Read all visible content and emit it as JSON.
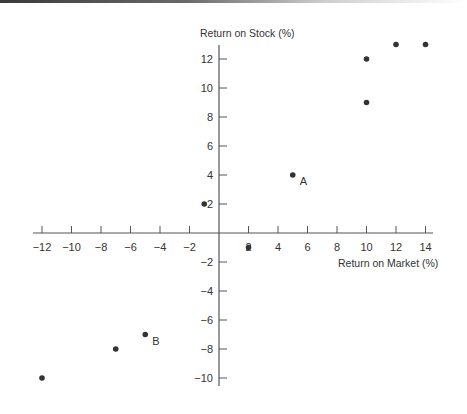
{
  "chart_data": {
    "type": "scatter",
    "title": "",
    "xlabel": "Return on Market (%)",
    "ylabel": "Return on Stock (%)",
    "xlim": [
      -12.5,
      14.5
    ],
    "ylim": [
      -10.5,
      12.5
    ],
    "x_ticks": [
      -12,
      -10,
      -8,
      -6,
      -4,
      -2,
      2,
      4,
      6,
      8,
      10,
      12,
      14
    ],
    "y_ticks": [
      -10,
      -8,
      -6,
      -4,
      -2,
      2,
      4,
      6,
      8,
      10,
      12
    ],
    "grid": false,
    "legend": null,
    "series": [
      {
        "name": "Stock vs Market returns",
        "points": [
          {
            "x": -12,
            "y": -10,
            "label": ""
          },
          {
            "x": -7,
            "y": -8,
            "label": ""
          },
          {
            "x": -5,
            "y": -7,
            "label": "B"
          },
          {
            "x": -1,
            "y": 2,
            "label": ""
          },
          {
            "x": 2,
            "y": -1,
            "label": ""
          },
          {
            "x": 5,
            "y": 4,
            "label": "A"
          },
          {
            "x": 10,
            "y": 9,
            "label": ""
          },
          {
            "x": 10,
            "y": 12,
            "label": ""
          },
          {
            "x": 12,
            "y": 13,
            "label": ""
          },
          {
            "x": 14,
            "y": 13,
            "label": ""
          }
        ]
      }
    ],
    "annotations": [
      "A",
      "B"
    ],
    "colors": {
      "points": "#333333",
      "axes": "#555555",
      "text": "#333333"
    }
  },
  "labels": {
    "x_axis_title": "Return on Market (%)",
    "y_axis_title": "Return on Stock (%)",
    "point_a": "A",
    "point_b": "B"
  }
}
